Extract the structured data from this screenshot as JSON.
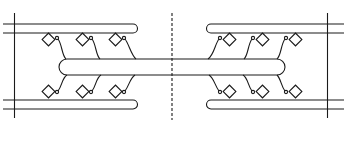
{
  "diagram": {
    "title": "",
    "stroke_color": "#1a1a1a",
    "background": "#ffffff",
    "labels": []
  }
}
